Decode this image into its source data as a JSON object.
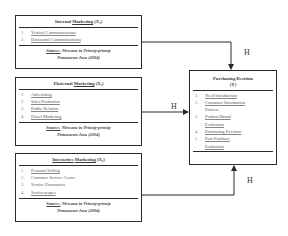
{
  "boxes": {
    "internal": {
      "title_word": "Internal",
      "title_underlined": "Marketing",
      "title_var": "(X₁)",
      "items": [
        {
          "num": "1.",
          "label": "Vertical Communications"
        },
        {
          "num": "2.",
          "label": "Horizontal Communications"
        }
      ],
      "source_label": "Source:",
      "source_text": "Nirwana in Prinsip-prinsip",
      "source_text2": "Pemasaran Jasa (2004)"
    },
    "external": {
      "title_word": "Eksternal",
      "title_underlined": "Marketing",
      "title_var": "(X₂)",
      "items": [
        {
          "num": "1.",
          "label": "Advertising"
        },
        {
          "num": "2.",
          "label": "Sales Promotion"
        },
        {
          "num": "3.",
          "label": "Public Relation"
        },
        {
          "num": "4.",
          "label": "Direct Marketing"
        }
      ],
      "source_label": "Source:",
      "source_text": "Nirwana in Prinsip-prinsip",
      "source_text2": "Pemasaran Jasa (2004)"
    },
    "interactive": {
      "title_word": "Interactive",
      "title_underlined": "Marketing",
      "title_var": "(X₃)",
      "items": [
        {
          "num": "1.",
          "label": "Personal Selling"
        },
        {
          "num": "2.",
          "label": "Customer Service Center"
        },
        {
          "num": "3.",
          "label": "Service Encounters"
        },
        {
          "num": "4.",
          "label": "Servicescapes"
        }
      ],
      "source_label": "Source:",
      "source_text": "Nirwana in Prinsip-prinsip",
      "source_text2": "Pemasaran Jasa (2004)"
    },
    "purchasing": {
      "title": "Purchasing Decision",
      "title_var": "(Y)",
      "items": [
        {
          "num": "1.",
          "label": "Need Introduction"
        },
        {
          "num": "2.",
          "label": "Consumer Information"
        },
        {
          "num": "",
          "label": "Process"
        },
        {
          "num": "3.",
          "label": "Product/Brand"
        },
        {
          "num": "",
          "label": "Evaluation"
        },
        {
          "num": "4.",
          "label": "Purchasing Decision"
        },
        {
          "num": "5.",
          "label": "Post-Purchase"
        },
        {
          "num": "",
          "label": "Evaluation"
        }
      ]
    }
  },
  "arrows": {
    "top_label": "H",
    "middle_label": "H",
    "bottom_label": "H"
  },
  "colors": {
    "line": "#2a2a2a",
    "text": "#3a3a3a"
  }
}
